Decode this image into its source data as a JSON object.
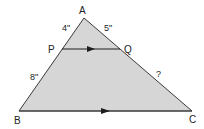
{
  "diagram": {
    "type": "similar-triangles",
    "colors": {
      "fill": "#d6d6d6",
      "stroke": "#3a3a3a",
      "text": "#222222"
    },
    "vertices": {
      "A": {
        "label": "A",
        "x": 84,
        "y": 18
      },
      "P": {
        "label": "P",
        "x": 62,
        "y": 49
      },
      "Q": {
        "label": "Q",
        "x": 120,
        "y": 49
      },
      "B": {
        "label": "B",
        "x": 19,
        "y": 111
      },
      "C": {
        "label": "C",
        "x": 192,
        "y": 111
      }
    },
    "segment_labels": {
      "AP": "4\"",
      "AQ": "5\"",
      "PB": "8\"",
      "QC": "?"
    },
    "parallel_marks": {
      "PQ": "arrow-right",
      "BC": "arrow-right"
    }
  }
}
